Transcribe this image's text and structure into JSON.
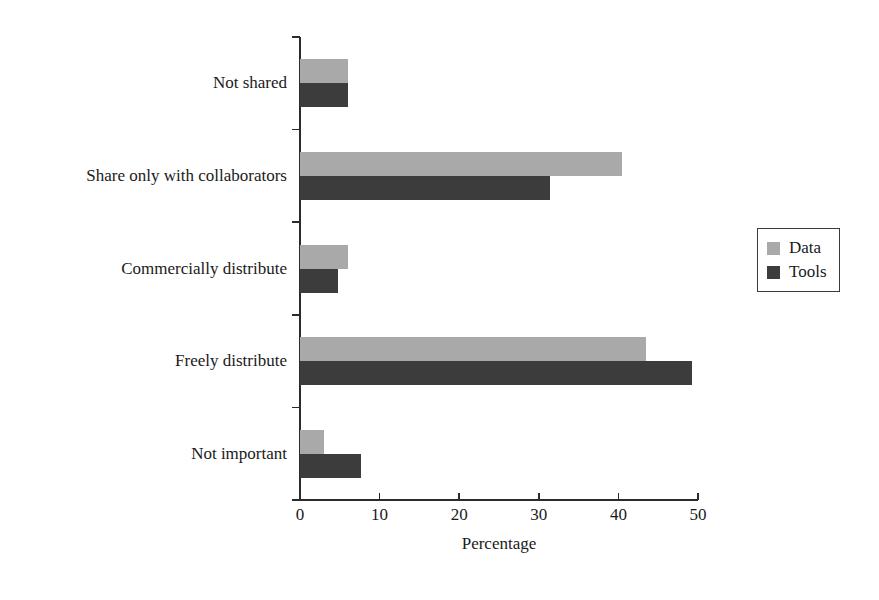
{
  "chart_data": {
    "type": "bar",
    "orientation": "horizontal",
    "title": "",
    "xlabel": "Percentage",
    "ylabel": "",
    "categories": [
      "Not shared",
      "Share only with collaborators",
      "Commercially distribute",
      "Freely distribute",
      "Not important"
    ],
    "series": [
      {
        "name": "Data",
        "color": "#a9a9a9",
        "values": [
          6.0,
          40.5,
          6.0,
          43.5,
          3.0
        ]
      },
      {
        "name": "Tools",
        "color": "#3c3c3c",
        "values": [
          6.0,
          31.4,
          4.8,
          49.2,
          7.7
        ]
      }
    ],
    "xlim": [
      0,
      50
    ],
    "xticks": [
      0,
      10,
      20,
      30,
      40,
      50
    ],
    "xtick_labels": [
      "0",
      "10",
      "20",
      "30",
      "40",
      "50"
    ],
    "grid": false,
    "legend": {
      "position": "right",
      "entries": [
        "Data",
        "Tools"
      ]
    }
  },
  "axis": {
    "x_title": "Percentage",
    "tick_labels": [
      "0",
      "10",
      "20",
      "30",
      "40",
      "50"
    ]
  },
  "legend": {
    "items": [
      {
        "label": "Data"
      },
      {
        "label": "Tools"
      }
    ]
  },
  "categories": {
    "c0": "Not shared",
    "c1": "Share only with collaborators",
    "c2": "Commercially distribute",
    "c3": "Freely distribute",
    "c4": "Not important"
  }
}
